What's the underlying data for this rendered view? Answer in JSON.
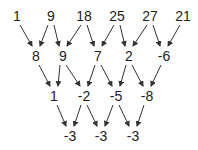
{
  "diagram": {
    "type": "difference-triangle",
    "rows": [
      [
        "1",
        "9",
        "18",
        "25",
        "27",
        "21"
      ],
      [
        "8",
        "9",
        "7",
        "2",
        "-6"
      ],
      [
        "1",
        "-2",
        "-5",
        "-8"
      ],
      [
        "-3",
        "-3",
        "-3"
      ]
    ],
    "row_y": [
      9,
      49,
      89,
      129
    ],
    "row_x": [
      [
        17,
        51,
        84,
        117,
        150,
        183
      ],
      [
        36,
        63,
        98,
        129,
        164
      ],
      [
        54,
        84,
        116,
        147
      ],
      [
        70,
        101,
        133
      ]
    ],
    "text_color": "#222222",
    "arrow_color": "#333333"
  }
}
